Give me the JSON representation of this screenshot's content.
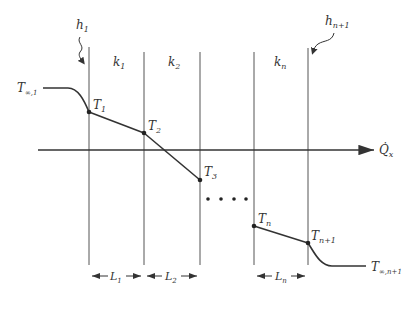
{
  "diagram": {
    "boundary_labels": {
      "left": {
        "base": "h",
        "sub": "1"
      },
      "right": {
        "base": "h",
        "sub": "n+1"
      }
    },
    "layers": [
      {
        "k": {
          "base": "k",
          "sub": "1"
        },
        "L": {
          "base": "L",
          "sub": "1"
        }
      },
      {
        "k": {
          "base": "k",
          "sub": "2"
        },
        "L": {
          "base": "L",
          "sub": "2"
        }
      },
      {
        "k": {
          "base": "k",
          "sub": "n"
        },
        "L": {
          "base": "L",
          "sub": "n"
        }
      }
    ],
    "temperatures": {
      "T_inf_1": {
        "base": "T",
        "sub": "∞,1"
      },
      "T1": {
        "base": "T",
        "sub": "1"
      },
      "T2": {
        "base": "T",
        "sub": "2"
      },
      "T3": {
        "base": "T",
        "sub": "3"
      },
      "Tn": {
        "base": "T",
        "sub": "n"
      },
      "Tn1": {
        "base": "T",
        "sub": "n+1"
      },
      "T_inf_n1": {
        "base": "T",
        "sub": "∞,n+1"
      }
    },
    "heat_flow_label": {
      "base": "Q̇",
      "sub": "x"
    },
    "ellipsis": "• • • •",
    "colors": {
      "line": "#333333",
      "background": "#ffffff"
    }
  }
}
